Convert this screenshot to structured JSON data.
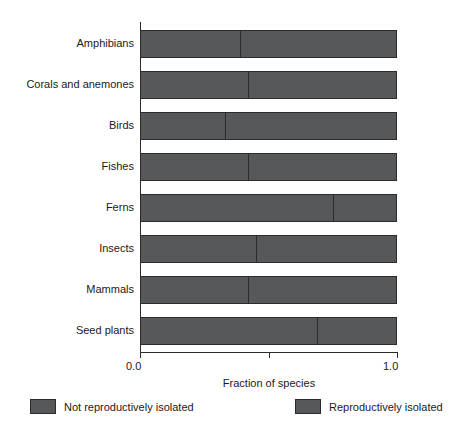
{
  "chart_data": {
    "type": "bar",
    "orientation": "horizontal",
    "stacked": true,
    "title": "",
    "xlabel": "Fraction of species",
    "ylabel": "",
    "xlim": [
      0.0,
      1.0
    ],
    "xticks": [
      0.0,
      0.5,
      1.0
    ],
    "xticklabels": [
      "0.0",
      "",
      "1.0"
    ],
    "grid": false,
    "legend_position": "bottom",
    "categories": [
      "Amphibians",
      "Corals and anemones",
      "Birds",
      "Fishes",
      "Ferns",
      "Insects",
      "Mammals",
      "Seed plants"
    ],
    "series": [
      {
        "name": "Not reproductively isolated",
        "color": "#57585a",
        "values": [
          0.39,
          0.42,
          0.33,
          0.42,
          0.75,
          0.45,
          0.42,
          0.69
        ]
      },
      {
        "name": "Reproductively isolated",
        "color": "#57585a",
        "values": [
          0.61,
          0.58,
          0.67,
          0.58,
          0.25,
          0.55,
          0.58,
          0.31
        ]
      }
    ]
  },
  "axis": {
    "x_title": "Fraction of species",
    "tick_min_label": "0.0",
    "tick_max_label": "1.0"
  },
  "legend": {
    "items": [
      {
        "label": "Not reproductively isolated",
        "swatch": "#57585a"
      },
      {
        "label": "Reproductively isolated",
        "swatch": "#57585a"
      }
    ]
  },
  "colors": {
    "bar_fill": "#57585a",
    "outline": "#2b2b2b",
    "background": "#ffffff",
    "text": "#1a1a1a"
  }
}
